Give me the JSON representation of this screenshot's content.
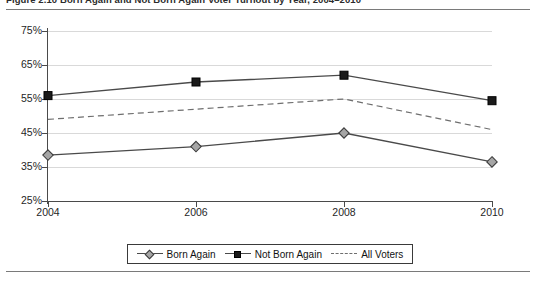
{
  "figure": {
    "caption": "Figure 2.10   Born Again and Not Born Again Voter Turnout by Year, 2004–2010"
  },
  "chart_data": {
    "type": "line",
    "title": "",
    "xlabel": "",
    "ylabel": "",
    "categories": [
      "2004",
      "2006",
      "2008",
      "2010"
    ],
    "ylim": [
      25,
      75
    ],
    "ytick_labels": [
      "25%",
      "35%",
      "45%",
      "55%",
      "65%",
      "75%"
    ],
    "ytick_values": [
      25,
      35,
      45,
      55,
      65,
      75
    ],
    "grid": true,
    "legend_position": "bottom",
    "series": [
      {
        "name": "Born Again",
        "marker": "diamond",
        "line_style": "solid",
        "color": "#4a4a4a",
        "marker_fill": "#a6a6a6",
        "values": [
          38.5,
          41.0,
          45.0,
          36.5
        ]
      },
      {
        "name": "Not Born Again",
        "marker": "square",
        "line_style": "solid",
        "color": "#4a4a4a",
        "marker_fill": "#1a1a1a",
        "values": [
          56.0,
          60.0,
          62.0,
          54.5
        ]
      },
      {
        "name": "All Voters",
        "marker": "none",
        "line_style": "dashed",
        "color": "#6e6e6e",
        "marker_fill": "none",
        "values": [
          49.0,
          52.0,
          55.0,
          46.0
        ]
      }
    ]
  },
  "legend": {
    "items": [
      {
        "label": "Born Again"
      },
      {
        "label": "Not Born Again"
      },
      {
        "label": "All Voters"
      }
    ]
  }
}
